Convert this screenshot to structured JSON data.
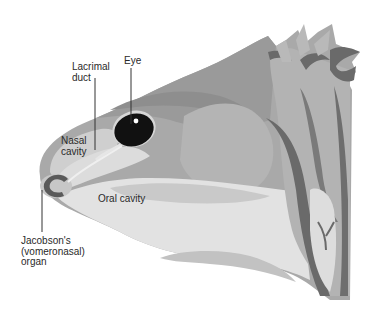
{
  "diagram": {
    "labels": {
      "lacrimal_duct": "Lacrimal\nduct",
      "eye": "Eye",
      "nasal_cavity": "Nasal\ncavity",
      "oral_cavity": "Oral cavity",
      "jacobsons_organ": "Jacobson's\n(vomeronasal)\norgan"
    },
    "colors": {
      "background": "#ffffff",
      "skin_dark": "#8e8e8e",
      "skin_mid": "#a9a9a9",
      "skin_light": "#c4c4c4",
      "cavity_light": "#dedede",
      "cavity_pale": "#e8e8e8",
      "crest_dark": "#6a6a6a",
      "eye": "#111111",
      "leader_line": "#333333",
      "label_text": "#2a2a2a"
    }
  }
}
